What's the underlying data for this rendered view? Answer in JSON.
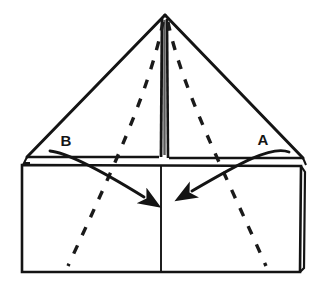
{
  "figure": {
    "kind": "origami-fold-diagram",
    "title": "",
    "background_color": "#ffffff",
    "line_color": "#141414",
    "dash_color": "#1a1a1a",
    "width": 322,
    "height": 287
  },
  "labels": [
    {
      "id": "label-b",
      "text": "B",
      "x": 66,
      "y": 146
    },
    {
      "id": "label-a",
      "text": "A",
      "x": 257,
      "y": 145
    }
  ],
  "shapes": {
    "triangle": {
      "name": "upper-triangle-flap",
      "apex": {
        "x": 165,
        "y": 14
      },
      "left_vertex": {
        "x": 27,
        "y": 157
      },
      "right_vertex": {
        "x": 303,
        "y": 158
      },
      "base_y": 157
    },
    "rectangle": {
      "name": "lower-rectangle-body",
      "left": 22,
      "top": 165,
      "right": 301,
      "bottom": 272,
      "center_divider_x": 161
    },
    "center_slit": {
      "name": "center-vertical-slit",
      "left_line_x": 161,
      "right_line_x": 168,
      "top_y": 18,
      "bottom_y": 158
    }
  },
  "fold_lines": [
    {
      "id": "dashed-fold-left",
      "style": "dashed",
      "from": {
        "x": 163,
        "y": 22
      },
      "to": {
        "x": 68,
        "y": 266
      }
    },
    {
      "id": "dashed-fold-right",
      "style": "dashed",
      "from": {
        "x": 168,
        "y": 22
      },
      "to": {
        "x": 266,
        "y": 266
      }
    }
  ],
  "arrows": [
    {
      "id": "arrow-b",
      "from_label": "B",
      "direction": "down-right",
      "start": {
        "x": 50,
        "y": 151
      },
      "end": {
        "x": 150,
        "y": 200
      }
    },
    {
      "id": "arrow-a",
      "from_label": "A",
      "direction": "down-left",
      "start": {
        "x": 288,
        "y": 152
      },
      "end": {
        "x": 186,
        "y": 194
      }
    }
  ],
  "accessibility": {
    "description": "Origami folding diagram: a triangular flap above a rectangle, with dashed fold lines radiating from the triangle apex, and two curved arrows labeled B (pointing down-right) and A (pointing down-left)."
  }
}
